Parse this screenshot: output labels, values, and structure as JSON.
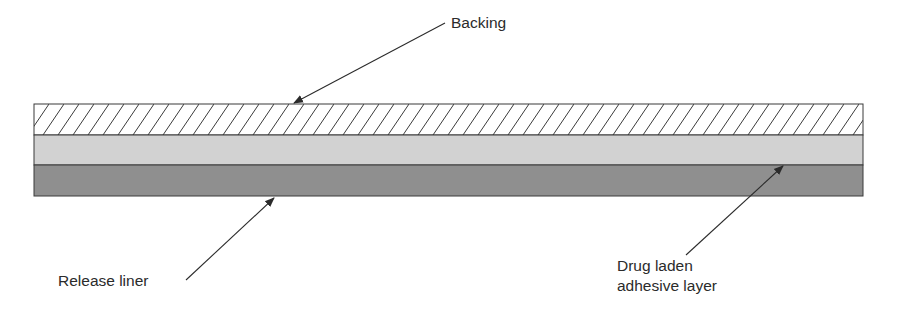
{
  "figure": {
    "layers": [
      {
        "name": "Backing",
        "pattern": "diagonal-hatch",
        "fill": "#ffffff",
        "stroke": "#3a3a3a"
      },
      {
        "name": "Drug laden adhesive layer",
        "pattern": "solid",
        "fill": "#d2d2d2"
      },
      {
        "name": "Release liner",
        "pattern": "solid",
        "fill": "#8f8f8f"
      }
    ],
    "labels": {
      "backing": "Backing",
      "release_liner": "Release liner",
      "drug_line1": "Drug laden",
      "drug_line2": "adhesive layer"
    },
    "colors": {
      "outline": "#3a3a3a",
      "text": "#2b2b2b",
      "hatch": "#3a3a3a",
      "adhesive": "#d2d2d2",
      "liner": "#8f8f8f"
    }
  }
}
